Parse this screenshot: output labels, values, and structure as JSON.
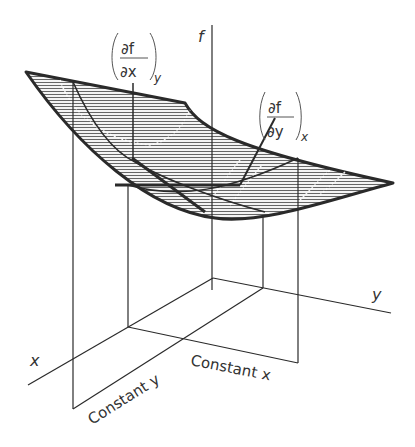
{
  "diagram": {
    "type": "3d-surface-partial-derivatives",
    "axes": {
      "f": "f",
      "x": "x",
      "y": "y"
    },
    "labels": {
      "partial_x": {
        "num": "∂f",
        "den": "∂x",
        "subscript": "y"
      },
      "partial_y": {
        "num": "∂f",
        "den": "∂y",
        "subscript": "x"
      },
      "constant_y": "Constant y",
      "constant_x": "Constant x"
    },
    "colors": {
      "line": "#2a2a2a",
      "hatch": "#555555",
      "surface_fill": "#e8e8e8"
    }
  }
}
